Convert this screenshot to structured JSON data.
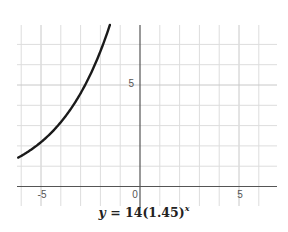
{
  "chart_data": {
    "type": "line",
    "function": {
      "a": 14,
      "b": 1.45,
      "expression": "y = 14(1.45)^x"
    },
    "xlabel": "",
    "ylabel": "",
    "xlim": [
      -6.2,
      6.9
    ],
    "ylim": [
      -1,
      7.9
    ],
    "x_ticks_labeled": [
      -5,
      0,
      5
    ],
    "y_ticks_labeled": [
      5
    ],
    "grid": true,
    "grid_step": 1,
    "legend": null,
    "series": [
      {
        "name": "y = 14(1.45)^x",
        "x": [
          -6.15,
          -6,
          -5.5,
          -5,
          -4.5,
          -4,
          -3.5,
          -3,
          -2.5,
          -2,
          -1.5
        ],
        "y": [
          1.43,
          1.51,
          1.82,
          2.19,
          2.64,
          3.17,
          3.82,
          4.59,
          5.53,
          6.66,
          8.0
        ]
      }
    ],
    "colors": {
      "curve": "#1a1a1a",
      "axis": "#555555",
      "grid": "#dddddd"
    }
  },
  "labels": {
    "x_tick_neg5": "-5",
    "origin": "0",
    "x_tick_5": "5",
    "y_tick_5": "5"
  },
  "equation": {
    "lhs": "y",
    "equals": " = ",
    "coef": "14",
    "base": "(1.45)",
    "exponent": "x"
  }
}
